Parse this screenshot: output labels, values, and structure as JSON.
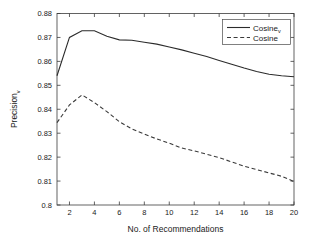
{
  "chart_data": {
    "type": "line",
    "title": "",
    "xlabel": "No. of Recommendations",
    "ylabel": "Precision",
    "ylabel_subscript": "v",
    "xlim": [
      1,
      20
    ],
    "ylim": [
      0.8,
      0.88
    ],
    "grid": false,
    "legend_position": "upper right",
    "x_ticks": [
      2,
      4,
      6,
      8,
      10,
      12,
      14,
      16,
      18,
      20
    ],
    "x_tick_labels": [
      "2",
      "4",
      "6",
      "8",
      "10",
      "12",
      "14",
      "16",
      "18",
      "20"
    ],
    "y_ticks": [
      0.8,
      0.81,
      0.82,
      0.83,
      0.84,
      0.85,
      0.86,
      0.87,
      0.88
    ],
    "y_tick_labels": [
      "0.8",
      "0.81",
      "0.82",
      "0.83",
      "0.84",
      "0.85",
      "0.86",
      "0.87",
      "0.88"
    ],
    "x": [
      1,
      2,
      3,
      4,
      5,
      6,
      7,
      8,
      9,
      10,
      11,
      12,
      13,
      14,
      15,
      16,
      17,
      18,
      19,
      20
    ],
    "series": [
      {
        "name": "Cosine",
        "name_subscript": "v",
        "style": "solid",
        "color": "#2b2b2b",
        "legend_label": "Cosine",
        "values": [
          0.854,
          0.87,
          0.8728,
          0.8728,
          0.8705,
          0.869,
          0.8688,
          0.868,
          0.8672,
          0.866,
          0.8648,
          0.8634,
          0.862,
          0.8604,
          0.8588,
          0.8572,
          0.8558,
          0.8546,
          0.854,
          0.8536
        ]
      },
      {
        "name": "Cosine",
        "style": "dashed",
        "color": "#3a3a3a",
        "legend_label": "Cosine",
        "values": [
          0.8344,
          0.8418,
          0.846,
          0.8428,
          0.839,
          0.8348,
          0.8318,
          0.8296,
          0.8276,
          0.8258,
          0.8238,
          0.8226,
          0.8212,
          0.8198,
          0.818,
          0.8162,
          0.8148,
          0.8134,
          0.812,
          0.8098
        ]
      }
    ]
  }
}
